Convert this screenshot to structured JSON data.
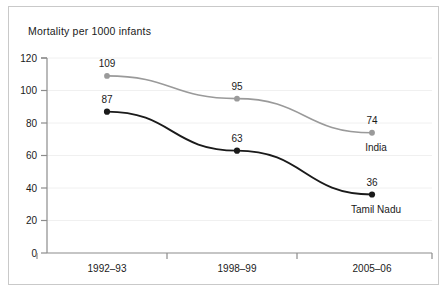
{
  "chart_data": {
    "type": "line",
    "title": "Mortality per 1000 infants",
    "xlabel": "",
    "ylabel": "",
    "categories": [
      "1992–93",
      "1998–99",
      "2005–06"
    ],
    "ylim": [
      0,
      120
    ],
    "yticks": [
      0,
      20,
      40,
      60,
      80,
      100,
      120
    ],
    "ytick_labels": [
      "0",
      "20",
      "40",
      "60",
      "80",
      "100",
      "120"
    ],
    "grid": true,
    "legend_position": "inline-right-of-last-point",
    "series": [
      {
        "name": "India",
        "color": "#9a9a9a",
        "values": [
          109,
          95,
          74
        ],
        "value_labels": [
          "109",
          "95",
          "74"
        ]
      },
      {
        "name": "Tamil Nadu",
        "color": "#1a1a1a",
        "values": [
          87,
          63,
          36
        ],
        "value_labels": [
          "87",
          "63",
          "36"
        ]
      }
    ]
  },
  "colors": {
    "india_line": "#9a9a9a",
    "tamil_nadu_line": "#1a1a1a",
    "axis": "#8c8c8c",
    "grid": "#f0f0f0",
    "border": "#c9c9c9",
    "text": "#1a1a1a"
  }
}
